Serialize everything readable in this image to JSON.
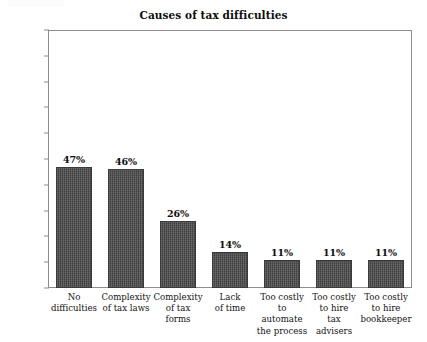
{
  "chart_data": {
    "type": "bar",
    "title": "Causes of tax difficulties",
    "xlabel": "",
    "ylabel": "",
    "ylim": [
      0,
      100
    ],
    "grid": false,
    "legend": "none",
    "value_suffix": "%",
    "categories": [
      "No difficulties",
      "Complexity of tax laws",
      "Complexity of tax forms",
      "Lack of time",
      "Too costly to automate the process",
      "Too costly to hire tax advisers",
      "Too costly to hire bookkeeper"
    ],
    "category_lines": [
      [
        "No",
        "difficulties"
      ],
      [
        "Complexity",
        "of tax laws"
      ],
      [
        "Complexity",
        "of tax forms"
      ],
      [
        "Lack",
        "of time"
      ],
      [
        "Too costly",
        "to automate",
        "the process"
      ],
      [
        "Too costly",
        "to hire",
        "tax advisers"
      ],
      [
        "Too costly",
        "to hire",
        "bookkeeper"
      ]
    ],
    "values": [
      47,
      46,
      26,
      14,
      11,
      11,
      11
    ],
    "value_labels": [
      "47%",
      "46%",
      "26%",
      "14%",
      "11%",
      "11%",
      "11%"
    ],
    "y_ticks": [
      0,
      10,
      20,
      30,
      40,
      50,
      60,
      70,
      80,
      90,
      100
    ],
    "y_tick_labels": [
      "0%",
      "10%",
      "20%",
      "30%",
      "40%",
      "50%",
      "60%",
      "70%",
      "80%",
      "90%",
      "100%"
    ],
    "colors": {
      "bar_fill": "#4b4b4b",
      "bar_border": "#3a3a3a",
      "frame": "#8d8d8d",
      "text": "#111111",
      "background": "#ffffff"
    }
  }
}
